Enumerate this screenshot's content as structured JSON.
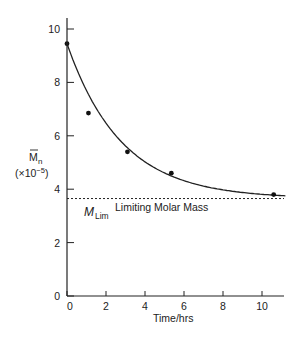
{
  "chart_data": {
    "type": "scatter",
    "title": "",
    "xlabel": "Time/hrs",
    "ylabel_main": "M",
    "ylabel_sub": "n",
    "ylabel_scale": "(×10",
    "ylabel_scale_exp": "−5",
    "ylabel_scale_close": ")",
    "xlim": [
      0,
      11.2
    ],
    "ylim": [
      0,
      10.5
    ],
    "xticks": [
      0,
      2,
      4,
      6,
      8,
      10
    ],
    "yticks": [
      0,
      2,
      4,
      6,
      8,
      10
    ],
    "grid": false,
    "series": [
      {
        "name": "Measured M̄n",
        "type": "scatter",
        "x": [
          0,
          1.1,
          3.1,
          5.35,
          10.6
        ],
        "y": [
          9.45,
          6.85,
          5.4,
          4.6,
          3.8
        ]
      },
      {
        "name": "Fitted curve",
        "type": "line",
        "model": "y = 3.65 + 5.8*exp(-0.36*x)"
      }
    ],
    "reference_line": {
      "y": 3.65,
      "style": "dashed",
      "label_symbol": "M",
      "label_sub": "Lim",
      "label_text": "Limiting Molar Mass"
    }
  }
}
